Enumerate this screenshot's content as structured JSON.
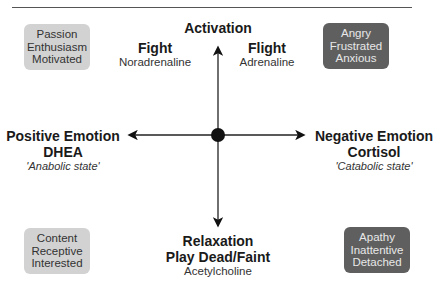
{
  "diagram": {
    "axes": {
      "top": {
        "title": "Activation"
      },
      "bottom": {
        "title": "Relaxation",
        "subtitle": "Play Dead/Faint",
        "note": "Acetylcholine"
      },
      "left": {
        "title": "Positive Emotion",
        "subtitle": "DHEA",
        "note": "'Anabolic state'"
      },
      "right": {
        "title": "Negative Emotion",
        "subtitle": "Cortisol",
        "note": "'Catabolic state'"
      }
    },
    "upper_labels": {
      "fight": {
        "title": "Fight",
        "note": "Noradrenaline"
      },
      "flight": {
        "title": "Flight",
        "note": "Adrenaline"
      }
    },
    "quadrants": {
      "top_left": {
        "lines": [
          "Passion",
          "Enthusiasm",
          "Motivated"
        ],
        "shade": "#d2d2d2"
      },
      "top_right": {
        "lines": [
          "Angry",
          "Frustrated",
          "Anxious"
        ],
        "shade": "#5f5f5f"
      },
      "bottom_left": {
        "lines": [
          "Content",
          "Receptive",
          "Interested"
        ],
        "shade": "#d2d2d2"
      },
      "bottom_right": {
        "lines": [
          "Apathy",
          "Inattentive",
          "Detached"
        ],
        "shade": "#5f5f5f"
      }
    }
  }
}
